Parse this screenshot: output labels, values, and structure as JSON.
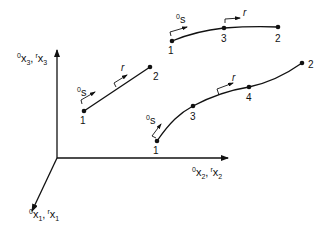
{
  "diagram": {
    "type": "coordinate-frame-with-elements",
    "axes": {
      "x1": {
        "label_main": "x",
        "sup_a": "0",
        "sub_a": "1",
        "sup_b": "r",
        "sub_b": "1"
      },
      "x2": {
        "label_main": "x",
        "sup_a": "0",
        "sub_a": "2",
        "sup_b": "r",
        "sub_b": "2"
      },
      "x3": {
        "label_main": "x",
        "sup_a": "0",
        "sub_a": "3",
        "sup_b": "r",
        "sub_b": "3"
      },
      "separator": ","
    },
    "elements": [
      {
        "name": "straight-line-element",
        "nodes": [
          {
            "id": "1",
            "label": "1"
          },
          {
            "id": "2",
            "label": "2"
          }
        ],
        "s_label": {
          "sup": "0",
          "main": "s"
        },
        "r_label": "r"
      },
      {
        "name": "curved-element-3-node",
        "nodes": [
          {
            "id": "1",
            "label": "1"
          },
          {
            "id": "3",
            "label": "3"
          },
          {
            "id": "2",
            "label": "2"
          }
        ],
        "s_label": {
          "sup": "0",
          "main": "s"
        },
        "r_label": "r"
      },
      {
        "name": "curved-element-4-node",
        "nodes": [
          {
            "id": "1",
            "label": "1"
          },
          {
            "id": "3",
            "label": "3"
          },
          {
            "id": "4",
            "label": "4"
          },
          {
            "id": "2",
            "label": "2"
          }
        ],
        "s_label": {
          "sup": "0",
          "main": "s"
        },
        "r_label": "r"
      }
    ],
    "colors": {
      "ink": "#111111",
      "background": "#ffffff"
    }
  }
}
